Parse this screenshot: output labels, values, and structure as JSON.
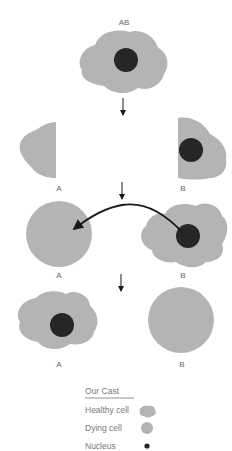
{
  "colors": {
    "cytoplasm": "#b4b4b4",
    "nucleus": "#262626",
    "arrow": "#1a1a1a",
    "label": "#666666"
  },
  "stages": [
    {
      "labels": [
        "AB"
      ]
    },
    {
      "labels": [
        "A",
        "B"
      ]
    },
    {
      "labels": [
        "A",
        "B"
      ]
    },
    {
      "labels": [
        "A",
        "B"
      ]
    }
  ],
  "legend": {
    "title": "Our Cast",
    "items": [
      {
        "label": "Healthy cell",
        "icon": "healthy-cell-icon"
      },
      {
        "label": "Dying cell",
        "icon": "dying-cell-icon"
      },
      {
        "label": "Nucleus",
        "icon": "nucleus-icon"
      }
    ]
  }
}
